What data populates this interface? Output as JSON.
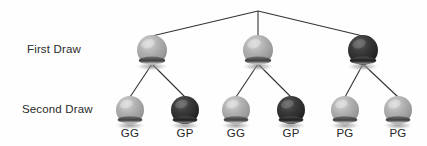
{
  "diagram": {
    "type": "probability-tree",
    "background_color": "#fefefe",
    "line_color": "#333333",
    "colors": {
      "light_ball": "#a8a8a8",
      "light_ball_highlight": "#d2d2d2",
      "light_ball_shade": "#8a8a8a",
      "dark_ball": "#2e2e2e",
      "dark_ball_highlight": "#5a5a5a",
      "dark_ball_shade": "#151515",
      "shadow": "#b5b5b5",
      "text": "#2b2b2b"
    },
    "root": {
      "x": 258,
      "y": 11
    },
    "rows": [
      {
        "id": "first-draw",
        "label": "First Draw",
        "label_x": 27,
        "label_y": 44,
        "ball_y": 50,
        "ball_r": 15,
        "nodes": [
          {
            "id": "first-draw-node-1",
            "x": 152,
            "shade": "light",
            "color": "#a8a8a8"
          },
          {
            "id": "first-draw-node-2",
            "x": 258,
            "shade": "light",
            "color": "#a8a8a8"
          },
          {
            "id": "first-draw-node-3",
            "x": 363,
            "shade": "dark",
            "color": "#2e2e2e"
          }
        ]
      },
      {
        "id": "second-draw",
        "label": "Second Draw",
        "label_x": 22,
        "label_y": 104,
        "ball_y": 110,
        "ball_r": 14,
        "nodes": [
          {
            "id": "second-draw-node-1",
            "x": 130,
            "shade": "light",
            "color": "#a8a8a8",
            "outcome": "GG",
            "parent": "first-draw-node-1"
          },
          {
            "id": "second-draw-node-2",
            "x": 185,
            "shade": "dark",
            "color": "#2e2e2e",
            "outcome": "GP",
            "parent": "first-draw-node-1"
          },
          {
            "id": "second-draw-node-3",
            "x": 236,
            "shade": "light",
            "color": "#a8a8a8",
            "outcome": "GG",
            "parent": "first-draw-node-2"
          },
          {
            "id": "second-draw-node-4",
            "x": 291,
            "shade": "dark",
            "color": "#2e2e2e",
            "outcome": "GP",
            "parent": "first-draw-node-2"
          },
          {
            "id": "second-draw-node-5",
            "x": 345,
            "shade": "light",
            "color": "#a8a8a8",
            "outcome": "PG",
            "parent": "first-draw-node-3"
          },
          {
            "id": "second-draw-node-6",
            "x": 398,
            "shade": "light",
            "color": "#a8a8a8",
            "outcome": "PG",
            "parent": "first-draw-node-3"
          }
        ]
      }
    ],
    "outcome_labels": [
      {
        "text": "GG",
        "x": 130
      },
      {
        "text": "GP",
        "x": 185
      },
      {
        "text": "GG",
        "x": 236
      },
      {
        "text": "GP",
        "x": 291
      },
      {
        "text": "PG",
        "x": 345
      },
      {
        "text": "PG",
        "x": 398
      }
    ]
  }
}
